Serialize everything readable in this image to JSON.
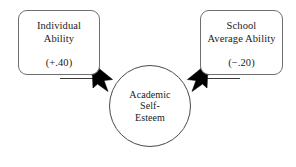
{
  "diagram": {
    "type": "path-diagram",
    "title": "",
    "background_color": "#ffffff",
    "line_color": "#333333",
    "arrow_color": "#000000",
    "box_border_color": "#6f6f6f",
    "circle_border_color": "#4a4a4a",
    "text_color": "#1a1a1a"
  },
  "nodes": {
    "individual_ability": {
      "label": "Individual\nAbility",
      "value": "(+.40)",
      "shape": "rounded-rectangle"
    },
    "school_average_ability": {
      "label": "School\nAverage Ability",
      "value": "(−.20)",
      "shape": "rounded-rectangle"
    },
    "academic_self_esteem": {
      "label": "Academic\nSelf-\nEsteem",
      "shape": "circle"
    }
  },
  "edges": [
    {
      "id": "edge-individual-to-esteem",
      "from": "individual_ability",
      "to": "academic_self_esteem",
      "coefficient": "(+.40)",
      "sign": "positive",
      "arrowhead": "filled"
    },
    {
      "id": "edge-school-to-esteem",
      "from": "school_average_ability",
      "to": "academic_self_esteem",
      "coefficient": "(−.20)",
      "sign": "negative",
      "arrowhead": "filled"
    }
  ]
}
